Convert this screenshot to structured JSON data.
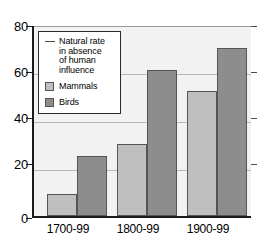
{
  "chart_data": {
    "type": "bar",
    "title": "",
    "xlabel": "",
    "ylabel": "",
    "categories": [
      "1700-99",
      "1800-99",
      "1900-99"
    ],
    "series": [
      {
        "name": "Mammals",
        "values": [
          9,
          30,
          52
        ],
        "color": "#bfbfbf"
      },
      {
        "name": "Birds",
        "values": [
          25,
          61,
          70
        ],
        "color": "#8d8d8d"
      }
    ],
    "ylim": [
      0,
      80
    ],
    "yticks": [
      0,
      20,
      40,
      60,
      80
    ],
    "ytick_labels": [
      "0",
      "20",
      "40",
      "60",
      "80"
    ],
    "grid": true,
    "legend_position": "top-left"
  },
  "legend": {
    "natural_rate_label": "Natural rate\nin absence\nof human\ninfluence",
    "natural_rate_line1": "Natural rate",
    "natural_rate_line2": "in absence",
    "natural_rate_line3": "of human",
    "natural_rate_line4": "influence",
    "mammals_label": "Mammals",
    "birds_label": "Birds"
  },
  "axis": {
    "y_labels": [
      "80",
      "60",
      "40",
      "20",
      "0"
    ],
    "x_labels": [
      "1700-99",
      "1800-99",
      "1900-99"
    ]
  },
  "colors": {
    "mammals": "#bfbfbf",
    "birds": "#8d8d8d",
    "plot_background": "#f2f2f2",
    "axis": "#1a1a1a",
    "gridline": "#b9b9b9"
  }
}
